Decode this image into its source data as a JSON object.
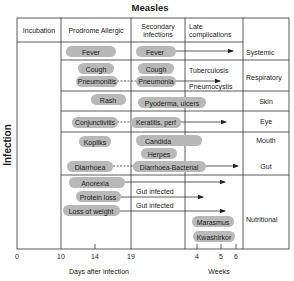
{
  "title": "Measles",
  "y_axis_label": "Infection",
  "columns": [
    "Incubation",
    "Prodrome Allergic",
    "Secondary infections",
    "Late complications"
  ],
  "column_header_lines": {
    "incubation": "Incubation",
    "prodrome": "Prodrome Allergic",
    "secondary_1": "Secondary",
    "secondary_2": "infections",
    "late_1": "Late",
    "late_2": "complications"
  },
  "categories": {
    "systemic": "Systemic",
    "respiratory": "Respiratory",
    "skin": "Skin",
    "eye": "Eye",
    "mouth": "Mouth",
    "gut": "Gut",
    "nutritional": "Nutritional"
  },
  "prodrome": {
    "fever": "Fever",
    "cough": "Cough",
    "pneumonitis": "Pneumonitis",
    "rash": "Rash",
    "conjunctivitis": "Conjunctivitis",
    "kopliks": "Kopliks",
    "diarrhoea": "Diarrhoea",
    "anorexia": "Anorexia",
    "protein_loss": "Protein loss",
    "loss_of_weight": "Loss of weight"
  },
  "secondary": {
    "fever": "Fever",
    "cough": "Cough",
    "pneumonia": "Pneumonia",
    "pyoderma": "Pyoderma, ulcers",
    "keratitis": "Keratitis, perf",
    "candida": "Candida",
    "herpes": "Herpes",
    "diarrhoea_bacterial": "Diarrhoea-Bacterial",
    "gut_infected_1": "Gut infected",
    "gut_infected_2": "Gut infected"
  },
  "late": {
    "tuberculosis": "Tuberculosis",
    "pneumocystis": "Pneumocystis",
    "marasmus": "Marasmus",
    "kwashirkor": "Kwashirkor"
  },
  "x_axis": {
    "days_ticks": [
      "0",
      "10",
      "14",
      "19"
    ],
    "days_label": "Days after infection",
    "weeks_ticks": [
      "4",
      "5",
      "6"
    ],
    "weeks_label": "Weeks"
  }
}
